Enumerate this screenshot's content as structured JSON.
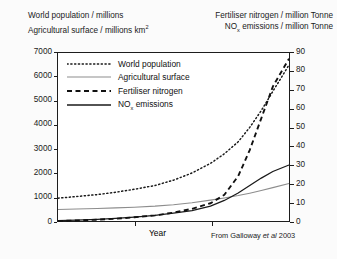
{
  "header": {
    "left_line1": "World population / millions",
    "left_line2_pre": "Agricultural surface / millions km",
    "left_line2_sup": "2",
    "right_line1": "Fertiliser nitrogen / million Tonne",
    "right_line2_pre": "NO",
    "right_line2_sub": "x",
    "right_line2_post": " emissions / million Tonne"
  },
  "xlabel": "Year",
  "credit_pre": "From Galloway ",
  "credit_italic": "et al",
  "credit_post": " 2003",
  "legend": {
    "items": [
      {
        "label": "World population",
        "style": "dotted",
        "color": "#1a1a1a",
        "name": "legend-world-population"
      },
      {
        "label": "Agricultural surface",
        "style": "solid-light",
        "color": "#8d8d8d",
        "name": "legend-agricultural-surface"
      },
      {
        "label": "Fertiliser nitrogen",
        "style": "dashed",
        "color": "#111111",
        "name": "legend-fertiliser-nitrogen"
      },
      {
        "label": "NOx emissions",
        "style": "solid",
        "color": "#1a1a1a",
        "name": "legend-nox-emissions"
      }
    ],
    "nox_pre": "NO",
    "nox_sub": "x",
    "nox_post": " emissions"
  },
  "axes": {
    "left_ticks": [
      "7000",
      "6000",
      "5000",
      "4000",
      "3000",
      "2000",
      "1000",
      "0"
    ],
    "right_ticks": [
      "90",
      "80",
      "70",
      "60",
      "50",
      "40",
      "30",
      "20",
      "10",
      "0"
    ],
    "left_min": 0,
    "left_max": 7000,
    "right_min": 0,
    "right_max": 90,
    "x_tick_count": 2
  },
  "chart_data": {
    "type": "line",
    "title": "",
    "xlabel": "Year",
    "ylabel": "World population / millions; Agricultural surface / millions km2",
    "ylabel_right": "Fertiliser nitrogen / million Tonne; NOx emissions / million Tonne",
    "ylim": [
      0,
      7000
    ],
    "ylim_right": [
      0,
      90
    ],
    "grid": false,
    "legend_position": "upper-left-inside",
    "x": [
      0,
      0.08,
      0.17,
      0.25,
      0.33,
      0.42,
      0.5,
      0.58,
      0.66,
      0.72,
      0.78,
      0.83,
      0.88,
      0.93,
      1.0
    ],
    "x_note": "Normalised time axis (unlabelled ticks at 1/3 and 2/3 of range)",
    "series": [
      {
        "name": "World population",
        "axis": "left",
        "units": "millions",
        "style": "dotted",
        "values": [
          950,
          1020,
          1100,
          1200,
          1320,
          1480,
          1700,
          2000,
          2400,
          2800,
          3300,
          3900,
          4600,
          5400,
          6500
        ]
      },
      {
        "name": "Agricultural surface",
        "axis": "left",
        "units": "millions km2",
        "style": "solid-light",
        "values": [
          480,
          500,
          520,
          545,
          575,
          620,
          680,
          760,
          870,
          960,
          1060,
          1160,
          1270,
          1390,
          1560
        ]
      },
      {
        "name": "Fertiliser nitrogen",
        "axis": "right",
        "units": "million Tonne",
        "style": "dashed",
        "values": [
          0,
          0.3,
          0.7,
          1.2,
          2,
          3,
          4.5,
          6.5,
          9.5,
          14,
          24,
          38,
          55,
          72,
          87
        ]
      },
      {
        "name": "NOx emissions",
        "axis": "right",
        "units": "million Tonne",
        "style": "solid",
        "values": [
          0.2,
          0.5,
          0.9,
          1.4,
          2.1,
          3,
          4.2,
          5.6,
          8,
          11,
          15,
          19,
          23,
          26.5,
          30
        ]
      }
    ]
  }
}
